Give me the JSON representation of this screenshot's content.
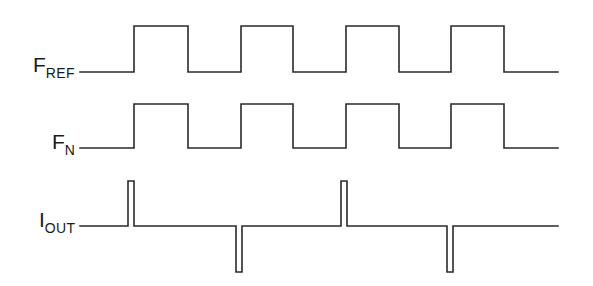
{
  "diagram": {
    "type": "timing-diagram",
    "stroke_color": "#2a2a2a",
    "signals": [
      {
        "id": "fref",
        "label_main": "F",
        "label_sub": "REF",
        "kind": "square-wave",
        "periods": 4,
        "points": "80,72 134,72 134,26 188,26 188,72 241,72 241,26 293,26 293,72 346,72 346,26 399,26 399,72 451,72 451,26 504,26 504,72 558,72"
      },
      {
        "id": "fn",
        "label_main": "F",
        "label_sub": "N",
        "kind": "square-wave",
        "periods": 4,
        "points": "80,148 134,148 134,104 188,104 188,148 241,148 241,104 293,104 293,148 346,148 346,104 399,104 399,148 451,148 451,104 504,104 504,148 558,148"
      },
      {
        "id": "iout",
        "label_main": "I",
        "label_sub": "OUT",
        "kind": "pulse-train",
        "pulses": [
          "up",
          "down",
          "up",
          "down"
        ],
        "points": "80,226 128,226 128,181 134,181 134,226 236,226 236,272 242,272 242,226 341,226 341,181 347,181 347,226 447,226 447,272 453,272 453,226 558,226"
      }
    ]
  }
}
